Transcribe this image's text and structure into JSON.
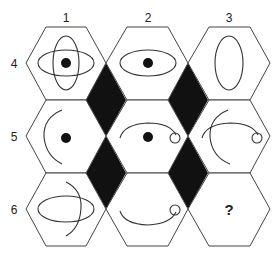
{
  "puzzle": {
    "column_labels": [
      "1",
      "2",
      "3"
    ],
    "row_labels": [
      "4",
      "5",
      "6"
    ],
    "missing_cell_symbol": "?",
    "colors": {
      "outline": "#444444",
      "diamond_fill": "#111111",
      "dot_fill": "#111111",
      "background": "#ffffff"
    },
    "cells": [
      {
        "row": "4",
        "col": "1",
        "contents": [
          "horizontal-ellipse",
          "vertical-ellipse",
          "dot"
        ]
      },
      {
        "row": "4",
        "col": "2",
        "contents": [
          "horizontal-ellipse",
          "dot"
        ]
      },
      {
        "row": "4",
        "col": "3",
        "contents": [
          "vertical-ellipse"
        ]
      },
      {
        "row": "5",
        "col": "1",
        "contents": [
          "left-arc",
          "dot"
        ]
      },
      {
        "row": "5",
        "col": "2",
        "contents": [
          "top-arc-with-loop",
          "dot"
        ]
      },
      {
        "row": "5",
        "col": "3",
        "contents": [
          "left-arc",
          "top-arc-with-loop"
        ]
      },
      {
        "row": "6",
        "col": "1",
        "contents": [
          "horizontal-ellipse",
          "right-arc"
        ]
      },
      {
        "row": "6",
        "col": "2",
        "contents": [
          "bottom-arc-with-loop"
        ]
      },
      {
        "row": "6",
        "col": "3",
        "contents": [
          "?"
        ]
      }
    ]
  }
}
